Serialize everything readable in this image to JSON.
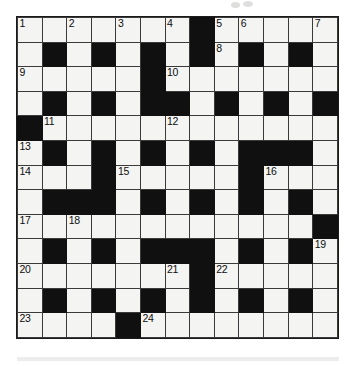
{
  "document": {
    "type": "crossword-puzzle-grid",
    "title": "Crossword Puzzle",
    "columns": 13,
    "rows": 13,
    "cell_size_px": 24.8,
    "colors": {
      "block": "#101010",
      "cell": "#f4f4f2",
      "grid_line": "#3a3a3a",
      "number_text": "#0d0d0d",
      "page_background": "#ffffff"
    }
  },
  "grid": {
    "legend": {
      "0": "white-open-cell",
      "1": "black-blocked-cell"
    },
    "rows": [
      [
        0,
        0,
        0,
        0,
        0,
        0,
        0,
        1,
        0,
        0,
        0,
        0,
        0
      ],
      [
        0,
        1,
        0,
        1,
        0,
        1,
        0,
        1,
        0,
        1,
        0,
        1,
        0
      ],
      [
        0,
        0,
        0,
        0,
        0,
        1,
        0,
        0,
        0,
        0,
        0,
        0,
        0
      ],
      [
        0,
        1,
        0,
        1,
        0,
        1,
        1,
        0,
        1,
        0,
        1,
        0,
        1
      ],
      [
        1,
        0,
        0,
        0,
        0,
        0,
        0,
        0,
        0,
        0,
        0,
        0,
        0
      ],
      [
        0,
        1,
        0,
        1,
        0,
        1,
        0,
        1,
        0,
        1,
        1,
        1,
        0
      ],
      [
        0,
        0,
        0,
        1,
        0,
        0,
        0,
        0,
        0,
        1,
        0,
        0,
        0
      ],
      [
        0,
        1,
        1,
        1,
        0,
        1,
        0,
        1,
        0,
        1,
        0,
        1,
        0
      ],
      [
        0,
        0,
        0,
        0,
        0,
        0,
        0,
        0,
        0,
        0,
        0,
        0,
        1
      ],
      [
        0,
        1,
        0,
        1,
        0,
        1,
        1,
        1,
        0,
        1,
        0,
        1,
        0
      ],
      [
        0,
        0,
        0,
        0,
        0,
        0,
        0,
        1,
        0,
        0,
        0,
        0,
        0
      ],
      [
        0,
        1,
        0,
        1,
        0,
        1,
        0,
        1,
        0,
        1,
        0,
        1,
        0
      ],
      [
        0,
        0,
        0,
        0,
        1,
        0,
        0,
        0,
        0,
        0,
        0,
        0,
        0
      ]
    ]
  },
  "clue_numbers": [
    {
      "number": "1",
      "row": 0,
      "col": 0
    },
    {
      "number": "2",
      "row": 0,
      "col": 2
    },
    {
      "number": "3",
      "row": 0,
      "col": 4
    },
    {
      "number": "4",
      "row": 0,
      "col": 6
    },
    {
      "number": "5",
      "row": 0,
      "col": 8
    },
    {
      "number": "6",
      "row": 0,
      "col": 9
    },
    {
      "number": "7",
      "row": 0,
      "col": 12
    },
    {
      "number": "8",
      "row": 1,
      "col": 8
    },
    {
      "number": "9",
      "row": 2,
      "col": 0
    },
    {
      "number": "10",
      "row": 2,
      "col": 6
    },
    {
      "number": "11",
      "row": 4,
      "col": 1
    },
    {
      "number": "12",
      "row": 4,
      "col": 6
    },
    {
      "number": "13",
      "row": 5,
      "col": 0
    },
    {
      "number": "14",
      "row": 6,
      "col": 0
    },
    {
      "number": "15",
      "row": 6,
      "col": 4
    },
    {
      "number": "16",
      "row": 6,
      "col": 10
    },
    {
      "number": "17",
      "row": 8,
      "col": 0
    },
    {
      "number": "18",
      "row": 8,
      "col": 2
    },
    {
      "number": "19",
      "row": 9,
      "col": 12
    },
    {
      "number": "20",
      "row": 10,
      "col": 0
    },
    {
      "number": "21",
      "row": 10,
      "col": 6
    },
    {
      "number": "22",
      "row": 10,
      "col": 8
    },
    {
      "number": "23",
      "row": 12,
      "col": 0
    },
    {
      "number": "24",
      "row": 12,
      "col": 5
    }
  ]
}
